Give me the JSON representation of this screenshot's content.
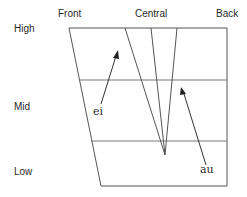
{
  "column_labels": {
    "front": "Front",
    "central": "Central",
    "back": "Back"
  },
  "row_labels": {
    "high": "High",
    "mid": "Mid",
    "low": "Low"
  },
  "diphthongs": [
    {
      "symbol": "ei",
      "from": "mid-front",
      "to": "high-front"
    },
    {
      "symbol": "au",
      "from": "low-back-central",
      "to": "mid-back-central"
    }
  ],
  "centering_point_label": "",
  "colors": {
    "lines": "#555555",
    "text": "#2a2a2a",
    "background": "#ffffff"
  }
}
